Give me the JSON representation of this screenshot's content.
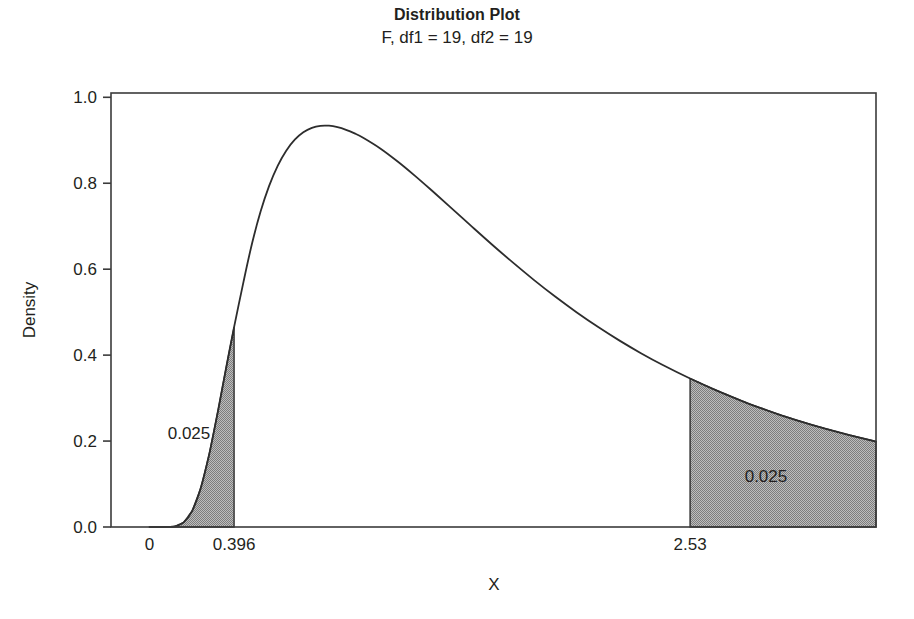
{
  "chart_data": {
    "type": "line",
    "title": "Distribution Plot",
    "subtitle": "F, df1 = 19, df2 = 19",
    "distribution": "F",
    "df1": 19,
    "df2": 19,
    "xlabel": "X",
    "ylabel": "Density",
    "xlim": [
      -0.18,
      3.4
    ],
    "ylim": [
      0.0,
      1.01
    ],
    "grid": false,
    "legend": null,
    "x_ticks": [
      {
        "value": 0,
        "label": "0"
      },
      {
        "value": 0.396,
        "label": "0.396"
      },
      {
        "value": 2.53,
        "label": "2.53"
      }
    ],
    "y_ticks": [
      {
        "value": 0.0,
        "label": "0.0"
      },
      {
        "value": 0.2,
        "label": "0.2"
      },
      {
        "value": 0.4,
        "label": "0.4"
      },
      {
        "value": 0.6,
        "label": "0.6"
      },
      {
        "value": 0.8,
        "label": "0.8"
      },
      {
        "value": 1.0,
        "label": "1.0"
      }
    ],
    "peak": {
      "x": 0.8,
      "y": 0.955
    },
    "shaded_regions": [
      {
        "name": "lower-tail",
        "from": 0.0,
        "to": 0.396,
        "area": 0.025,
        "label": "0.025",
        "label_x": 0.185,
        "label_y": 0.205
      },
      {
        "name": "upper-tail",
        "from": 2.53,
        "to": 3.4,
        "area": 0.025,
        "label": "0.025",
        "label_x": 2.885,
        "label_y": 0.105
      }
    ],
    "curve": {
      "x": [
        0.0,
        0.04,
        0.08,
        0.12,
        0.16,
        0.2,
        0.24,
        0.28,
        0.32,
        0.36,
        0.396,
        0.44,
        0.48,
        0.52,
        0.56,
        0.6,
        0.64,
        0.68,
        0.72,
        0.76,
        0.8,
        0.84,
        0.88,
        0.92,
        0.96,
        1.0,
        1.08,
        1.16,
        1.24,
        1.32,
        1.4,
        1.5,
        1.6,
        1.7,
        1.8,
        1.9,
        2.0,
        2.1,
        2.2,
        2.3,
        2.4,
        2.53,
        2.65,
        2.8,
        2.95,
        3.1,
        3.25,
        3.4
      ],
      "y": [
        0.0,
        0.0,
        0.0001,
        0.0017,
        0.0107,
        0.0374,
        0.0905,
        0.1702,
        0.2685,
        0.3736,
        0.465,
        0.5705,
        0.6599,
        0.734,
        0.7938,
        0.8405,
        0.8758,
        0.9013,
        0.9185,
        0.9289,
        0.9337,
        0.9339,
        0.9306,
        0.9244,
        0.916,
        0.9058,
        0.8809,
        0.8511,
        0.8183,
        0.7836,
        0.748,
        0.7031,
        0.6587,
        0.6157,
        0.5746,
        0.5357,
        0.4993,
        0.4653,
        0.4337,
        0.4045,
        0.3775,
        0.3455,
        0.3186,
        0.2879,
        0.2611,
        0.2377,
        0.2171,
        0.1989
      ]
    }
  },
  "layout": {
    "plot_left": 111,
    "plot_right": 876,
    "plot_top": 93,
    "plot_bottom": 527,
    "axis_color": "#3b3b3b",
    "curve_color": "#2d2d2d",
    "fill_color": "#9b9b9b",
    "background": "#ffffff"
  },
  "labels": {
    "x_axis_title": "X",
    "y_axis_title": "Density"
  }
}
